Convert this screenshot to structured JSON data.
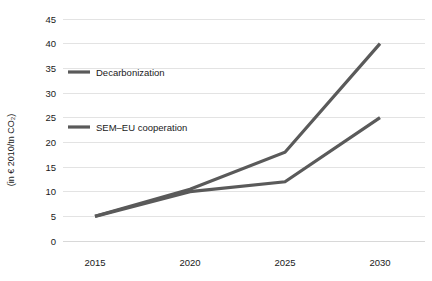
{
  "chart_data": {
    "type": "line",
    "title": "",
    "subtitle": "",
    "xlabel": "",
    "ylabel": "(in € 2010/tn CO₂)",
    "categories": [
      "2015",
      "2020",
      "2025",
      "2030"
    ],
    "x": [
      2015,
      2020,
      2025,
      2030
    ],
    "xlim": [
      2015,
      2030
    ],
    "ylim": [
      0,
      45
    ],
    "y_ticks": [
      0,
      5,
      10,
      15,
      20,
      25,
      30,
      35,
      40,
      45
    ],
    "y_tick_labels": [
      "0",
      "5",
      "10",
      "15",
      "20",
      "25",
      "30",
      "35",
      "40",
      "45"
    ],
    "x_tick_labels": [
      "2015",
      "2020",
      "2025",
      "2030"
    ],
    "grid": "horizontal",
    "legend_position": "inside-plot-left",
    "series": [
      {
        "name": "Decarbonization",
        "values": [
          5,
          10.5,
          18,
          40
        ],
        "color": "#5a5a5a"
      },
      {
        "name": "SEM–EU cooperation",
        "values": [
          5,
          10,
          12,
          25
        ],
        "color": "#5a5a5a"
      }
    ],
    "annotations": []
  },
  "legend": {
    "items": [
      {
        "label": "Decarbonization",
        "swatch": "line-swatch"
      },
      {
        "label": "SEM–EU cooperation",
        "swatch": "line-swatch"
      }
    ]
  },
  "colors": {
    "series_line": "#5a5a5a",
    "gridline": "#e3e3e3",
    "text": "#1a1a1a",
    "background": "#ffffff"
  }
}
